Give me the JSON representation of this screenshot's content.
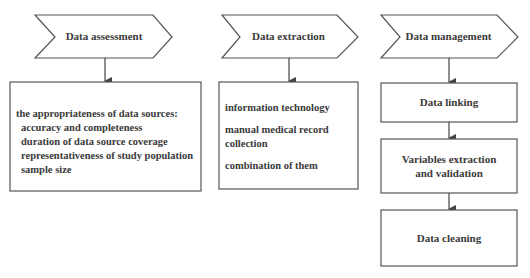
{
  "columns": [
    {
      "header": "Data assessment",
      "content": {
        "title": "the appropriateness of data sources:",
        "items": [
          "accuracy and completeness",
          "duration of data source coverage",
          "representativeness of study population",
          "sample size"
        ]
      }
    },
    {
      "header": "Data extraction",
      "content": {
        "items": [
          "information technology",
          "manual medical record collection",
          "combination of them"
        ]
      }
    },
    {
      "header": "Data management",
      "steps": [
        "Data linking",
        "Variables extraction and validation",
        "Data cleaning"
      ]
    }
  ],
  "colors": {
    "stroke": "#555555",
    "text": "#3a3a3a",
    "background": "#ffffff"
  }
}
